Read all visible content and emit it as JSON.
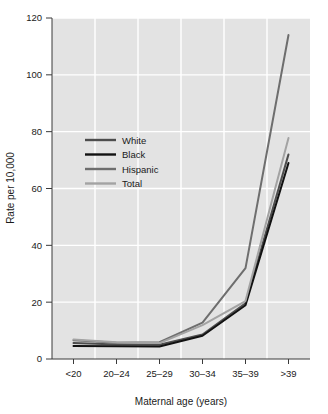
{
  "chart_data": {
    "type": "line",
    "title": "",
    "xlabel": "Maternal age (years)",
    "ylabel": "Rate per 10,000",
    "categories": [
      "<20",
      "20–24",
      "25–29",
      "30–34",
      "35–39",
      ">39"
    ],
    "ylim": [
      0,
      120
    ],
    "yticks": [
      0,
      20,
      40,
      60,
      80,
      100,
      120
    ],
    "ytick_labels": [
      "0",
      "20",
      "40",
      "60",
      "80",
      "100",
      "120"
    ],
    "grid": true,
    "legend_position": "upper-left-inside",
    "series": [
      {
        "name": "White",
        "color": "#4d4d4d",
        "values": [
          5.6,
          5.1,
          5.0,
          8.6,
          19.6,
          72.0
        ]
      },
      {
        "name": "Black",
        "color": "#121212",
        "values": [
          4.6,
          4.5,
          4.4,
          8.2,
          18.9,
          69.0
        ]
      },
      {
        "name": "Hispanic",
        "color": "#6e6e6e",
        "values": [
          6.6,
          5.7,
          5.9,
          12.8,
          32.0,
          114.0
        ]
      },
      {
        "name": "Total",
        "color": "#a3a3a3",
        "values": [
          6.9,
          5.9,
          5.6,
          11.9,
          20.4,
          77.8
        ]
      }
    ]
  },
  "legend": {
    "entries": [
      {
        "label": "White"
      },
      {
        "label": "Black"
      },
      {
        "label": "Hispanic"
      },
      {
        "label": "Total"
      }
    ]
  },
  "style": {
    "plot_background": "#e3e3e3",
    "gridline_color": "#ffffff",
    "axis_color": "#3a3a3a",
    "figure_background": "#ffffff"
  }
}
